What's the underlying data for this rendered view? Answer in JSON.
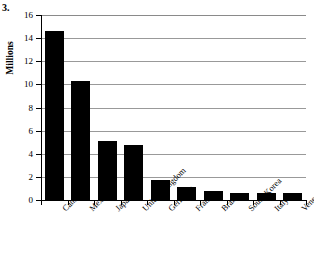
{
  "figure": {
    "number_label": "3."
  },
  "chart_data": {
    "type": "bar",
    "title": "",
    "subtitle": "",
    "xlabel": "",
    "ylabel": "Millions",
    "ylim": [
      0,
      16
    ],
    "ytick_values": [
      0,
      2,
      4,
      6,
      8,
      10,
      12,
      14,
      16
    ],
    "ytick_labels": [
      "0",
      "2",
      "4",
      "6",
      "8",
      "10",
      "12",
      "14",
      "16"
    ],
    "grid": "horizontal",
    "legend": "none",
    "bar_color": "#000000",
    "gridline_color": "#999999",
    "axis_color": "#000000",
    "categories": [
      "Canada",
      "Mexico",
      "Japan",
      "United Kingdom",
      "Germany",
      "France",
      "Brazil",
      "South Korea",
      "Italy",
      "Venezuela"
    ],
    "values": [
      14.6,
      10.3,
      5.1,
      4.75,
      1.75,
      1.1,
      0.75,
      0.65,
      0.65,
      0.6
    ]
  }
}
